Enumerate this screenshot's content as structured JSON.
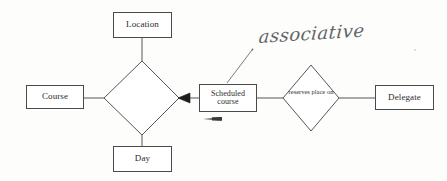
{
  "diagram": {
    "type": "er-diagram",
    "background_color": "#fdfdfc",
    "line_color": "#4a4a4a",
    "text_color": "#2b2b2b",
    "entities": [
      {
        "id": "location",
        "label": "Location",
        "x": 113,
        "y": 12,
        "w": 59,
        "h": 26
      },
      {
        "id": "course",
        "label": "Course",
        "x": 26,
        "y": 85,
        "w": 58,
        "h": 24
      },
      {
        "id": "day",
        "label": "Day",
        "x": 113,
        "y": 146,
        "w": 59,
        "h": 26
      },
      {
        "id": "scheduled_course",
        "label_line1": "Scheduled",
        "label_line2": "course",
        "x": 199,
        "y": 84,
        "w": 58,
        "h": 28
      },
      {
        "id": "delegate",
        "label": "Delegate",
        "x": 375,
        "y": 85,
        "w": 59,
        "h": 25
      }
    ],
    "relationships": [
      {
        "id": "central",
        "label": "",
        "cx": 141,
        "cy": 98,
        "rx": 38,
        "ry": 38
      },
      {
        "id": "reserves_place_on",
        "label_line1": "reserves",
        "label_line2": "place",
        "label_line3": "on",
        "cx": 311,
        "cy": 98,
        "rx": 28,
        "ry": 33
      }
    ],
    "connectors": [
      {
        "from": "location",
        "to": "central",
        "style": "plain"
      },
      {
        "from": "course",
        "to": "central",
        "style": "plain"
      },
      {
        "from": "day",
        "to": "central",
        "style": "plain"
      },
      {
        "from": "scheduled_course",
        "to": "central",
        "style": "filled-arrow",
        "arrow_direction": "left"
      },
      {
        "from": "scheduled_course",
        "to": "reserves_place_on",
        "style": "plain"
      },
      {
        "from": "reserves_place_on",
        "to": "delegate",
        "style": "plain"
      }
    ],
    "annotation": {
      "text": "associative",
      "handwritten": true,
      "target": "scheduled_course",
      "leader_line": {
        "x1": 227,
        "y1": 84,
        "x2": 252,
        "y2": 50
      },
      "color": "#55565a"
    },
    "marks": [
      {
        "id": "hand-arrow-below-scheduled",
        "shape": "small-left-arrow",
        "x": 203,
        "y": 118
      }
    ]
  }
}
